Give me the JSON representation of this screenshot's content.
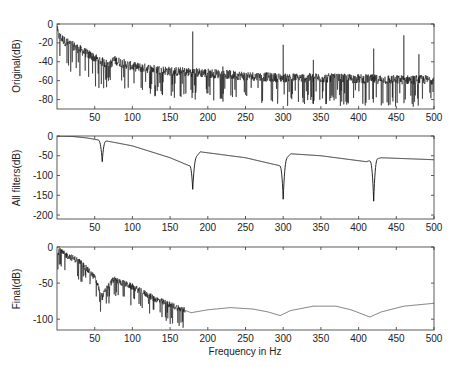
{
  "figure": {
    "width": 464,
    "height": 367,
    "background": "#ffffff",
    "line_color": "#111111",
    "axis_color": "#333333"
  },
  "chart_data": [
    {
      "type": "line",
      "id": "original",
      "title": "",
      "xlabel": "",
      "ylabel": "Original(dB)",
      "xlim": [
        0,
        500
      ],
      "ylim": [
        -90,
        0
      ],
      "xticks": [
        50,
        100,
        150,
        200,
        250,
        300,
        350,
        400,
        450,
        500
      ],
      "yticks": [
        0,
        -20,
        -40,
        -60,
        -80
      ],
      "grid": false,
      "box": {
        "left": 57,
        "top": 24,
        "right": 434,
        "bottom": 109
      },
      "style": "noisy",
      "envelope": {
        "x": [
          0,
          2,
          10,
          30,
          60,
          70,
          75,
          100,
          150,
          200,
          250,
          300,
          350,
          400,
          450,
          500
        ],
        "y": [
          -5,
          -12,
          -18,
          -27,
          -40,
          -44,
          -38,
          -45,
          -50,
          -52,
          -55,
          -57,
          -57,
          -58,
          -59,
          -59
        ]
      },
      "noise_amp": 10,
      "peaks": [
        {
          "x": 60,
          "y": -36
        },
        {
          "x": 180,
          "y": -8
        },
        {
          "x": 220,
          "y": -45
        },
        {
          "x": 300,
          "y": -22
        },
        {
          "x": 340,
          "y": -38
        },
        {
          "x": 420,
          "y": -26
        },
        {
          "x": 460,
          "y": -12
        },
        {
          "x": 480,
          "y": -32
        }
      ]
    },
    {
      "type": "line",
      "id": "all_filters",
      "title": "",
      "xlabel": "",
      "ylabel": "All filters(dB)",
      "xlim": [
        0,
        500
      ],
      "ylim": [
        -210,
        0
      ],
      "xticks": [
        50,
        100,
        150,
        200,
        250,
        300,
        350,
        400,
        450,
        500
      ],
      "yticks": [
        0,
        -50,
        -100,
        -150,
        -200
      ],
      "grid": false,
      "box": {
        "left": 57,
        "top": 136,
        "right": 434,
        "bottom": 219
      },
      "style": "smooth",
      "base": {
        "x": [
          0,
          20,
          40,
          55,
          70,
          100,
          150,
          175,
          190,
          250,
          295,
          310,
          350,
          410,
          430,
          500
        ],
        "y": [
          0,
          -1,
          -5,
          -10,
          -14,
          -25,
          -55,
          -75,
          -40,
          -55,
          -75,
          -45,
          -50,
          -65,
          -55,
          -60
        ]
      },
      "notches": [
        {
          "x": 60,
          "depth": -65
        },
        {
          "x": 180,
          "depth": -135
        },
        {
          "x": 300,
          "depth": -160
        },
        {
          "x": 420,
          "depth": -165
        }
      ]
    },
    {
      "type": "line",
      "id": "final",
      "title": "",
      "xlabel": "Frequency in Hz",
      "ylabel": "Final(dB)",
      "xlim": [
        0,
        500
      ],
      "ylim": [
        -115,
        0
      ],
      "xticks": [
        50,
        100,
        150,
        200,
        250,
        300,
        350,
        400,
        450,
        500
      ],
      "yticks": [
        0,
        -50,
        -100
      ],
      "grid": false,
      "box": {
        "left": 57,
        "top": 247,
        "right": 434,
        "bottom": 330
      },
      "style": "mixed",
      "noisy_until": 170,
      "envelope": {
        "x": [
          0,
          3,
          10,
          30,
          50,
          60,
          65,
          75,
          100,
          130,
          150,
          170
        ],
        "y": [
          -10,
          -5,
          -10,
          -20,
          -42,
          -70,
          -58,
          -45,
          -55,
          -72,
          -80,
          -88
        ]
      },
      "noise_amp": 9,
      "smooth": {
        "x": [
          170,
          178,
          200,
          230,
          260,
          280,
          296,
          310,
          340,
          370,
          390,
          415,
          430,
          460,
          500
        ],
        "y": [
          -88,
          -91,
          -87,
          -84,
          -86,
          -90,
          -95,
          -88,
          -82,
          -82,
          -87,
          -97,
          -90,
          -82,
          -78
        ]
      }
    }
  ]
}
